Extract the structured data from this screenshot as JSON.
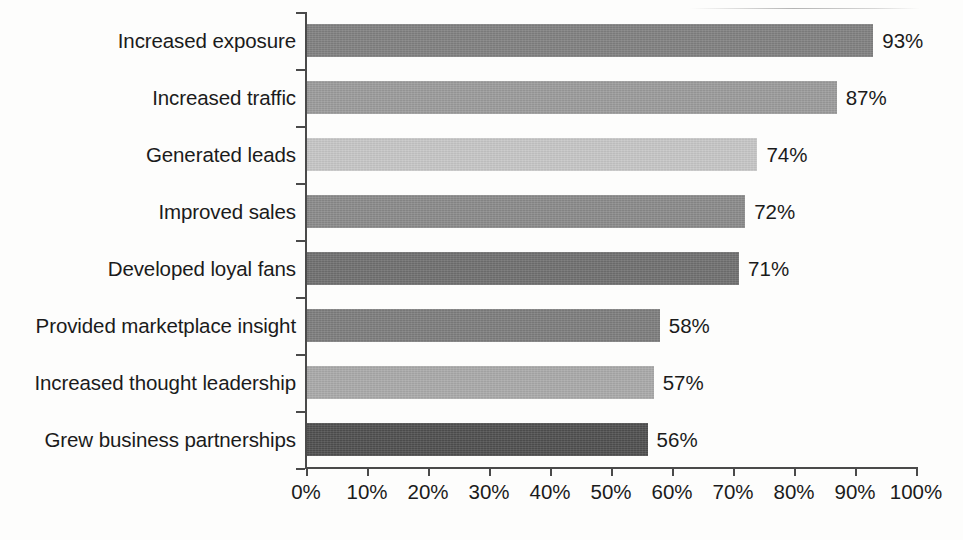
{
  "chart_data": {
    "type": "bar",
    "orientation": "horizontal",
    "title": "",
    "subtitle": "",
    "xlabel": "",
    "ylabel": "",
    "xlim": [
      0,
      100
    ],
    "xtick_step": 10,
    "grid": false,
    "legend": "none",
    "value_suffix": "%",
    "categories": [
      "Increased exposure",
      "Increased traffic",
      "Generated leads",
      "Improved sales",
      "Developed loyal fans",
      "Provided marketplace insight",
      "Increased thought leadership",
      "Grew business partnerships"
    ],
    "values": [
      93,
      87,
      74,
      72,
      71,
      58,
      57,
      56
    ],
    "value_labels": [
      "93%",
      "87%",
      "74%",
      "72%",
      "71%",
      "58%",
      "57%",
      "56%"
    ],
    "bar_colors": [
      "#808080",
      "#9b9b9b",
      "#c6c6c6",
      "#8a8a8a",
      "#6f6f6f",
      "#7d7d7d",
      "#a9a9a9",
      "#4f4f4f"
    ],
    "xtick_labels": [
      "0%",
      "10%",
      "20%",
      "30%",
      "40%",
      "50%",
      "60%",
      "70%",
      "80%",
      "90%",
      "100%"
    ],
    "xtick_values": [
      0,
      10,
      20,
      30,
      40,
      50,
      60,
      70,
      80,
      90,
      100
    ],
    "axis_color": "#4a4a4a",
    "text_color": "#1b1b1b",
    "background_color": "#fdfdfc"
  }
}
